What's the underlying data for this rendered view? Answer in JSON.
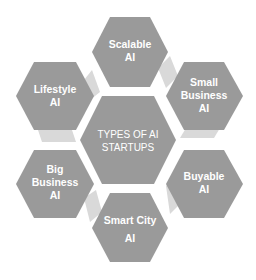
{
  "diagram": {
    "title": "TYPES OF AI STARTUPS",
    "center": {
      "lines": [
        "TYPES OF AI",
        "STARTUPS"
      ]
    },
    "nodes": [
      {
        "id": "scalable",
        "lines": [
          "Scalable",
          "AI"
        ]
      },
      {
        "id": "small-business",
        "lines": [
          "Small",
          "Business",
          "AI"
        ]
      },
      {
        "id": "buyable",
        "lines": [
          "Buyable",
          "AI"
        ]
      },
      {
        "id": "smart-city",
        "lines": [
          "Smart City",
          "AI"
        ]
      },
      {
        "id": "big-business",
        "lines": [
          "Big",
          "Business",
          "AI"
        ]
      },
      {
        "id": "lifestyle",
        "lines": [
          "Lifestyle",
          "AI"
        ]
      }
    ],
    "colors": {
      "hexagon_fill": "#9a9a9a",
      "connector_fill": "#d9d9d9",
      "text": "#ffffff",
      "background": "#ffffff"
    }
  }
}
